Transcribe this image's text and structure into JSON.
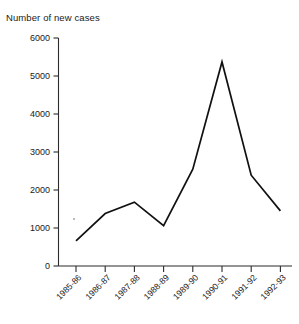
{
  "chart_data": {
    "type": "line",
    "title": "",
    "ylabel": "Number of new cases",
    "xlabel": "",
    "categories": [
      "1985-86",
      "1986-87",
      "1987-88",
      "1988-89",
      "1989-90",
      "1990-91",
      "1991-92",
      "1992-93"
    ],
    "values": [
      660,
      1380,
      1680,
      1060,
      2550,
      5370,
      2390,
      1450
    ],
    "series": [
      {
        "name": "Number of new cases",
        "values": [
          660,
          1380,
          1680,
          1060,
          2550,
          5370,
          2390,
          1450
        ]
      }
    ],
    "ylim": [
      0,
      6000
    ],
    "yticks": [
      0,
      1000,
      2000,
      3000,
      4000,
      5000,
      6000
    ],
    "ytick_labels": [
      "0",
      "1000",
      "2000",
      "3000",
      "4000",
      "5000",
      "6000"
    ],
    "grid": false,
    "legend": false,
    "line_color": "#111111",
    "axis_color": "#2b2b2b",
    "xtick_rotation": -45
  }
}
